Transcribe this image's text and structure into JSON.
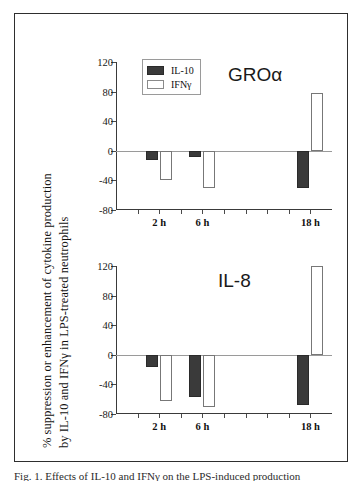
{
  "figure": {
    "y_axis_label_line1": "% suppression or enhancement of cytokine production",
    "y_axis_label_line2": "by IL-10 and IFNγ in LPS-treated neutrophils",
    "caption": "Fig. 1. Effects of IL-10 and IFNγ on the LPS-induced production"
  },
  "legend": {
    "items": [
      {
        "label": "IL-10",
        "swatch": "filled-dark-square",
        "color": "#3a3a3a"
      },
      {
        "label": "IFNγ",
        "swatch": "open-white-square",
        "color": "#ffffff"
      }
    ]
  },
  "chart_data": [
    {
      "type": "bar",
      "title": "GROα",
      "panel": "top",
      "categories": [
        "2 h",
        "6 h",
        "18 h"
      ],
      "series": [
        {
          "name": "IL-10",
          "values": [
            -13,
            -8,
            -50
          ],
          "color": "#3a3a3a"
        },
        {
          "name": "IFNγ",
          "values": [
            -40,
            -50,
            78
          ],
          "color": "#ffffff"
        }
      ],
      "xlabel": "",
      "ylabel": "% suppression or enhancement of cytokine production by IL-10 and IFNγ in LPS-treated neutrophils",
      "ylim": [
        -80,
        120
      ],
      "yticks": [
        120,
        80,
        40,
        0,
        -40,
        -80
      ],
      "ytick_labels": [
        "120",
        "80",
        "40",
        "0",
        "-40",
        "-80"
      ],
      "grid": false,
      "legend_position": "top-left",
      "xtick_count": 9,
      "category_tick_indices": [
        1,
        3,
        8
      ]
    },
    {
      "type": "bar",
      "title": "IL-8",
      "panel": "bottom",
      "categories": [
        "2 h",
        "6 h",
        "18 h"
      ],
      "series": [
        {
          "name": "IL-10",
          "values": [
            -17,
            -57,
            -68
          ],
          "color": "#3a3a3a"
        },
        {
          "name": "IFNγ",
          "values": [
            -62,
            -70,
            120
          ],
          "color": "#ffffff"
        }
      ],
      "xlabel": "",
      "ylabel": "% suppression or enhancement of cytokine production by IL-10 and IFNγ in LPS-treated neutrophils",
      "ylim": [
        -80,
        120
      ],
      "yticks": [
        120,
        80,
        40,
        0,
        -40,
        -80
      ],
      "ytick_labels": [
        "120",
        "80",
        "40",
        "0",
        "-40",
        "-80"
      ],
      "grid": false,
      "legend_position": "none",
      "xtick_count": 9,
      "category_tick_indices": [
        1,
        3,
        8
      ]
    }
  ]
}
